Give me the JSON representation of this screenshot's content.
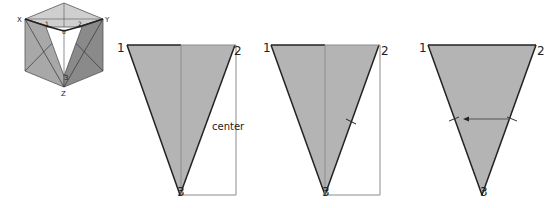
{
  "cube": {
    "labels": {
      "x": "X",
      "y": "Y",
      "z": "Z",
      "p1": "1",
      "p2": "2",
      "p3": "3",
      "origin": "0"
    }
  },
  "panels": [
    {
      "p1": "1",
      "p2": "2",
      "p3": "3",
      "annotation": "center"
    },
    {
      "p1": "1",
      "p2": "2",
      "p3": "3"
    },
    {
      "p1": "1",
      "p2": "2",
      "p3": "3"
    }
  ],
  "colors": {
    "fill": "#b4b4b4",
    "cube_light": "#c8c8c8",
    "cube_mid": "#9a9a9a",
    "cube_dark": "#7c7c7c",
    "edge": "#222222",
    "guide": "#8c8c8c"
  }
}
